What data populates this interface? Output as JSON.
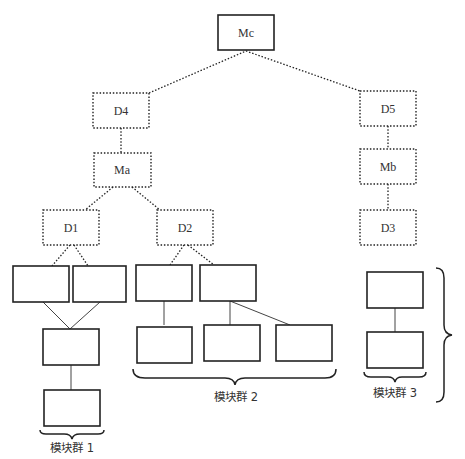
{
  "diagram": {
    "type": "hierarchy-tree",
    "nodes": {
      "mc": {
        "label": "Mc",
        "style": "solid"
      },
      "d4": {
        "label": "D4",
        "style": "dotted"
      },
      "d5": {
        "label": "D5",
        "style": "dotted"
      },
      "ma": {
        "label": "Ma",
        "style": "dotted"
      },
      "mb": {
        "label": "Mb",
        "style": "dotted"
      },
      "d1": {
        "label": "D1",
        "style": "dotted"
      },
      "d2": {
        "label": "D2",
        "style": "dotted"
      },
      "d3": {
        "label": "D3",
        "style": "dotted"
      }
    },
    "edges": [
      {
        "from": "Mc",
        "to": "D4",
        "style": "dotted"
      },
      {
        "from": "Mc",
        "to": "D5",
        "style": "dotted"
      },
      {
        "from": "D4",
        "to": "Ma",
        "style": "dotted"
      },
      {
        "from": "D5",
        "to": "Mb",
        "style": "dotted"
      },
      {
        "from": "Ma",
        "to": "D1",
        "style": "dotted"
      },
      {
        "from": "Ma",
        "to": "D2",
        "style": "dotted"
      },
      {
        "from": "Mb",
        "to": "D3",
        "style": "dotted"
      }
    ],
    "groups": [
      {
        "label": "模块群 1",
        "module_count": 4
      },
      {
        "label": "模块群 2",
        "module_count": 5
      },
      {
        "label": "模块群 3",
        "module_count": 2
      }
    ]
  }
}
